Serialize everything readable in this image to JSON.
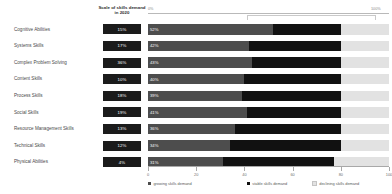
{
  "header": {
    "scale_column_title": "Scale of skills demand in 2020",
    "axis_top_left": "0%",
    "axis_top_right": "100%"
  },
  "axis": {
    "ticks": [
      0,
      20,
      40,
      60,
      80,
      100
    ],
    "tick_labels": [
      "0",
      "20",
      "40",
      "60",
      "80",
      "100"
    ]
  },
  "legend": {
    "items": [
      {
        "label": "growing skills demand",
        "color": "#4d4d4d"
      },
      {
        "label": "stable skills demand",
        "color": "#111111"
      },
      {
        "label": "declining skills demand",
        "color": "#e2e2e2"
      }
    ]
  },
  "colors": {
    "growing": "#4d4d4d",
    "stable": "#111111",
    "declining": "#e2e2e2",
    "chip_background": "#1b1b1b",
    "chip_text": "#ffffff"
  },
  "chart_data": {
    "type": "bar",
    "title": "",
    "subtitle": "",
    "xlabel": "",
    "ylabel": "",
    "xlim": [
      0,
      100
    ],
    "grid": false,
    "stacked": true,
    "orientation": "horizontal",
    "legend_position": "bottom",
    "categories": [
      "Cognitive Abilities",
      "Systems Skills",
      "Complex Problem Solving",
      "Content Skills",
      "Process Skills",
      "Social Skills",
      "Resource Management Skills",
      "Technical Skills",
      "Physical Abilities"
    ],
    "scale_of_demand_2020": [
      "15%",
      "17%",
      "36%",
      "10%",
      "18%",
      "19%",
      "13%",
      "12%",
      "4%"
    ],
    "series": [
      {
        "name": "growing skills demand",
        "values": [
          52,
          42,
          43,
          40,
          39,
          41,
          36,
          34,
          31
        ]
      },
      {
        "name": "stable skills demand",
        "values": [
          28,
          38,
          37,
          40,
          41,
          39,
          44,
          46,
          46
        ]
      },
      {
        "name": "declining skills demand",
        "values": [
          20,
          20,
          20,
          20,
          20,
          20,
          20,
          20,
          23
        ]
      }
    ],
    "bar_value_labels": [
      "52%",
      "42%",
      "43%",
      "40%",
      "39%",
      "41%",
      "36%",
      "34%",
      "31%"
    ]
  }
}
